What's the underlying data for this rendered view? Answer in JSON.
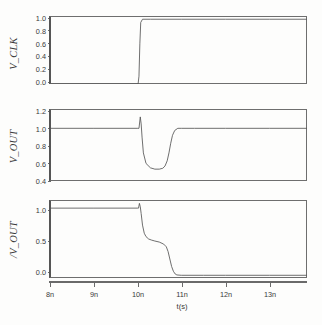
{
  "figure": {
    "xlabel": "t(s)",
    "x_ticks": [
      "8n",
      "9n",
      "10n",
      "11n",
      "12n",
      "13n"
    ],
    "x_tick_values": [
      8,
      9,
      10,
      11,
      12,
      13
    ],
    "xlim": [
      8,
      13.85
    ],
    "line_color": "#555555",
    "axis_color": "#6e6e6e"
  },
  "panels": [
    {
      "ylabel": "V_CLK",
      "y_ticks": [
        "0.0",
        "0.2",
        "0.4",
        "0.6",
        "0.8",
        "1.0"
      ],
      "y_tick_values": [
        0.0,
        0.2,
        0.4,
        0.6,
        0.8,
        1.0
      ],
      "ylim": [
        0.0,
        1.05
      ]
    },
    {
      "ylabel": "V_OUT",
      "y_ticks": [
        "0.4",
        "0.6",
        "0.8",
        "1.0",
        "1.2"
      ],
      "y_tick_values": [
        0.4,
        0.6,
        0.8,
        1.0,
        1.2
      ],
      "ylim": [
        0.4,
        1.22
      ]
    },
    {
      "ylabel": "/V_OUT",
      "y_ticks": [
        "0.0",
        "0.5",
        "1.0"
      ],
      "y_tick_values": [
        0.0,
        0.5,
        1.0
      ],
      "ylim": [
        -0.03,
        1.12
      ]
    }
  ],
  "chart_data": {
    "type": "line",
    "title": "",
    "xlabel": "t(s)",
    "xlim": [
      8,
      13.85
    ],
    "grid": false,
    "legend": "none",
    "subplots": [
      {
        "name": "V_CLK",
        "ylabel": "V_CLK",
        "ylim": [
          0.0,
          1.05
        ],
        "yticks": [
          0.0,
          0.2,
          0.4,
          0.6,
          0.8,
          1.0
        ],
        "series": [
          {
            "name": "V_CLK",
            "x": [
              8.0,
              9.0,
              10.0,
              10.02,
              10.04,
              10.06,
              10.08,
              10.12,
              10.3,
              11.0,
              12.0,
              13.0,
              13.85
            ],
            "y": [
              0.0,
              0.0,
              0.0,
              0.0,
              0.12,
              0.62,
              0.95,
              1.0,
              1.0,
              1.0,
              1.0,
              1.0,
              1.0
            ]
          }
        ]
      },
      {
        "name": "V_OUT",
        "ylabel": "V_OUT",
        "ylim": [
          0.4,
          1.22
        ],
        "yticks": [
          0.4,
          0.6,
          0.8,
          1.0,
          1.2
        ],
        "series": [
          {
            "name": "V_OUT",
            "x": [
              8.0,
              9.0,
              10.0,
              10.04,
              10.07,
              10.09,
              10.11,
              10.14,
              10.2,
              10.3,
              10.4,
              10.5,
              10.58,
              10.63,
              10.68,
              10.72,
              10.76,
              10.8,
              10.85,
              10.92,
              11.0,
              11.3,
              12.0,
              13.0,
              13.85
            ],
            "y": [
              1.0,
              1.0,
              1.0,
              1.0,
              1.13,
              1.05,
              0.9,
              0.72,
              0.6,
              0.55,
              0.535,
              0.535,
              0.545,
              0.57,
              0.63,
              0.72,
              0.83,
              0.92,
              0.975,
              1.0,
              1.0,
              1.0,
              1.0,
              1.0,
              1.0
            ]
          }
        ]
      },
      {
        "name": "/V_OUT",
        "ylabel": "/V_OUT",
        "ylim": [
          -0.03,
          1.12
        ],
        "yticks": [
          0.0,
          0.5,
          1.0
        ],
        "series": [
          {
            "name": "/V_OUT",
            "x": [
              8.0,
              9.0,
              10.0,
              10.03,
              10.05,
              10.07,
              10.09,
              10.12,
              10.16,
              10.2,
              10.26,
              10.32,
              10.4,
              10.5,
              10.6,
              10.66,
              10.7,
              10.74,
              10.78,
              10.82,
              10.86,
              10.9,
              11.0,
              11.5,
              12.0,
              13.0,
              13.85
            ],
            "y": [
              1.0,
              1.0,
              1.0,
              1.0,
              1.07,
              1.02,
              0.92,
              0.75,
              0.63,
              0.58,
              0.545,
              0.53,
              0.515,
              0.5,
              0.47,
              0.43,
              0.36,
              0.25,
              0.14,
              0.07,
              0.03,
              0.015,
              0.01,
              0.01,
              0.01,
              0.01,
              0.01
            ]
          }
        ]
      }
    ]
  }
}
